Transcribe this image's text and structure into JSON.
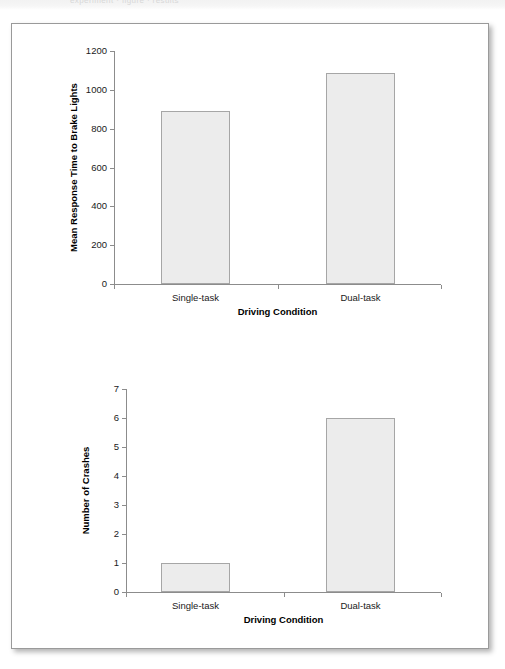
{
  "figure": {
    "background_color": "#ffffff",
    "frame_border_color": "#9a9a9a",
    "bar_fill_color": "#ececec",
    "bar_border_color": "#a6a6a6",
    "axis_color": "#8c8c8c",
    "ghost_strip_text": "experiment  ·  figure  ·  results"
  },
  "chart_data": [
    {
      "type": "bar",
      "title": "",
      "categories": [
        "Single-task",
        "Dual-task"
      ],
      "values": [
        890,
        1085
      ],
      "xlabel": "Driving Condition",
      "ylabel": "Mean Response Time to Brake Lights",
      "ylim": [
        0,
        1200
      ],
      "yticks": [
        0,
        200,
        400,
        600,
        800,
        1000,
        1200
      ],
      "ytick_labels": [
        "0",
        "200",
        "400",
        "600",
        "800",
        "1000",
        "1200"
      ],
      "grid": false,
      "legend": null
    },
    {
      "type": "bar",
      "title": "",
      "categories": [
        "Single-task",
        "Dual-task"
      ],
      "values": [
        1,
        6
      ],
      "xlabel": "Driving Condition",
      "ylabel": "Number of Crashes",
      "ylim": [
        0,
        7
      ],
      "yticks": [
        0,
        1,
        2,
        3,
        4,
        5,
        6,
        7
      ],
      "ytick_labels": [
        "0",
        "1",
        "2",
        "3",
        "4",
        "5",
        "6",
        "7"
      ],
      "grid": false,
      "legend": null
    }
  ]
}
